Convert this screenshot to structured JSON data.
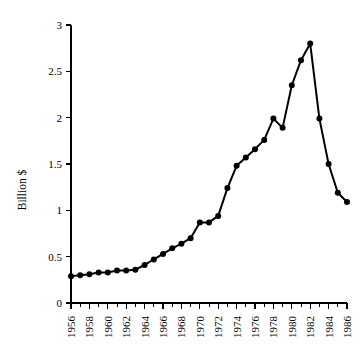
{
  "chart_data": {
    "type": "line",
    "title": "",
    "subtitle": "",
    "xlabel": "",
    "ylabel": "Billion $",
    "xlim": [
      1956,
      1986
    ],
    "ylim": [
      0,
      3
    ],
    "grid": false,
    "legend": false,
    "legend_position": "none",
    "series_color": "#000000",
    "marker": "filled-circle",
    "y_ticks": [
      0,
      0.5,
      1,
      1.5,
      2,
      2.5,
      3
    ],
    "y_tick_labels": [
      "0",
      "0.5",
      "1",
      "1.5",
      "2",
      "2.5",
      "3"
    ],
    "x_ticks": [
      1956,
      1957,
      1958,
      1959,
      1960,
      1961,
      1962,
      1963,
      1964,
      1965,
      1966,
      1967,
      1968,
      1969,
      1970,
      1971,
      1972,
      1973,
      1974,
      1975,
      1976,
      1977,
      1978,
      1979,
      1980,
      1981,
      1982,
      1983,
      1984,
      1985,
      1986
    ],
    "x_tick_labels": [
      "1956",
      "1958",
      "1960",
      "1962",
      "1964",
      "1966",
      "1968",
      "1970",
      "1972",
      "1974",
      "1976",
      "1978",
      "1980",
      "1982",
      "1984",
      "1986"
    ],
    "x_tick_label_years": [
      1956,
      1958,
      1960,
      1962,
      1964,
      1966,
      1968,
      1970,
      1972,
      1974,
      1976,
      1978,
      1980,
      1982,
      1984,
      1986
    ],
    "x_tick_label_rotation": -90,
    "x": [
      1956,
      1957,
      1958,
      1959,
      1960,
      1961,
      1962,
      1963,
      1964,
      1965,
      1966,
      1967,
      1968,
      1969,
      1970,
      1971,
      1972,
      1973,
      1974,
      1975,
      1976,
      1977,
      1978,
      1979,
      1980,
      1981,
      1982,
      1983,
      1984,
      1985,
      1986
    ],
    "values": [
      0.29,
      0.3,
      0.31,
      0.33,
      0.33,
      0.35,
      0.35,
      0.36,
      0.41,
      0.47,
      0.53,
      0.59,
      0.64,
      0.7,
      0.87,
      0.87,
      0.94,
      1.24,
      1.48,
      1.57,
      1.66,
      1.76,
      1.99,
      1.89,
      2.35,
      2.62,
      2.8,
      1.99,
      1.5,
      1.19,
      1.09
    ],
    "y_unit": "Billion $",
    "peak": {
      "year": 1982,
      "value": 2.8
    },
    "minimum": {
      "year": 1956,
      "value": 0.29
    }
  }
}
